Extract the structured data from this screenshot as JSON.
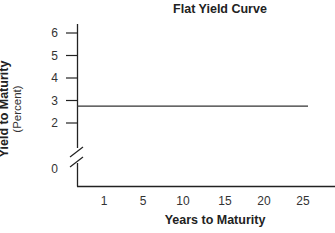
{
  "chart_data": {
    "type": "line",
    "title": "Flat Yield Curve",
    "xlabel": "Years to Maturity",
    "ylabel": "Yield to Maturity",
    "ylabel_sub": "(Percent)",
    "x_ticks": [
      "1",
      "5",
      "10",
      "15",
      "20",
      "25"
    ],
    "y_ticks": [
      "0",
      "2",
      "3",
      "4",
      "5",
      "6"
    ],
    "y_axis_break": true,
    "ylim": [
      0,
      6
    ],
    "grid": false,
    "legend": null,
    "series": [
      {
        "name": "Flat Yield Curve",
        "x": [
          0,
          1,
          5,
          10,
          15,
          20,
          25
        ],
        "values": [
          2.75,
          2.75,
          2.75,
          2.75,
          2.75,
          2.75,
          2.75
        ]
      }
    ],
    "colors": {
      "axis": "#222222",
      "line": "#333333"
    }
  }
}
